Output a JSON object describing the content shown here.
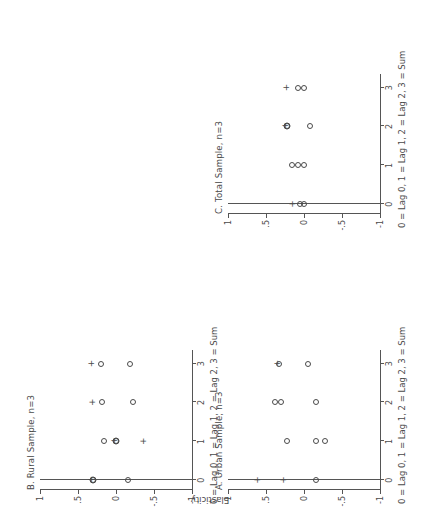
{
  "figure": {
    "y_axis_label": "Elasticity",
    "x_axis_caption": "0 = Lag 0, 1 = Lag 1, 2 = Lag 2, 3 = Sum",
    "y_ticklabels": [
      "1",
      ".5",
      "0",
      "-.5",
      "-1"
    ],
    "y_tickvalues": [
      1,
      0.5,
      0,
      -0.5,
      -1
    ],
    "x_ticklabels": [
      "0",
      "1",
      "2",
      "3"
    ],
    "x_tickvalues": [
      0,
      1,
      2,
      3
    ],
    "axis_color": "#555555",
    "marker_color": "#4a4a4a",
    "background": "#ffffff",
    "panels": [
      {
        "id": "A",
        "title": "A. Urban Sample, n=3"
      },
      {
        "id": "B",
        "title": "B. Rural Sample, n=3"
      },
      {
        "id": "C",
        "title": "C. Total Sample, n=3"
      }
    ]
  },
  "chart_data": [
    {
      "type": "scatter",
      "panel": "A",
      "title": "A. Urban Sample, n=3",
      "xlabel": "0 = Lag 0, 1 = Lag 1, 2 = Lag 2, 3 = Sum",
      "ylabel": "Elasticity",
      "xlim": [
        -0.25,
        3.35
      ],
      "ylim": [
        -1.0,
        1.0
      ],
      "xticks": [
        0,
        1,
        2,
        3
      ],
      "xticklabels": [
        "0",
        "1",
        "2",
        "3"
      ],
      "yticks": [
        1,
        0.5,
        0,
        -0.5,
        -1
      ],
      "yticklabels": [
        "1",
        ".5",
        "0",
        "-.5",
        "-1"
      ],
      "grid": false,
      "legend": false,
      "series": [
        {
          "name": "Estimate (circle)",
          "marker": "circle",
          "points": [
            {
              "x": 0.0,
              "y": -0.16
            },
            {
              "x": 1.0,
              "y": -0.16
            },
            {
              "x": 1.0,
              "y": -0.28
            },
            {
              "x": 1.0,
              "y": 0.22
            },
            {
              "x": 2.0,
              "y": -0.16
            },
            {
              "x": 2.0,
              "y": 0.3
            },
            {
              "x": 2.0,
              "y": 0.38
            },
            {
              "x": 3.0,
              "y": -0.05
            },
            {
              "x": 3.0,
              "y": 0.33
            }
          ]
        },
        {
          "name": "Significant (plus)",
          "marker": "plus",
          "points": [
            {
              "x": 0.0,
              "y": 0.28
            },
            {
              "x": 0.0,
              "y": 0.62
            },
            {
              "x": 3.0,
              "y": 0.36
            }
          ]
        }
      ]
    },
    {
      "type": "scatter",
      "panel": "B",
      "title": "B. Rural Sample, n=3",
      "xlabel": "0 = Lag 0, 1 = Lag 1, 2 = Lag 2, 3 = Sum",
      "ylabel": "Elasticity",
      "xlim": [
        -0.25,
        3.35
      ],
      "ylim": [
        -1.0,
        1.0
      ],
      "xticks": [
        0,
        1,
        2,
        3
      ],
      "xticklabels": [
        "0",
        "1",
        "2",
        "3"
      ],
      "yticks": [
        1,
        0.5,
        0,
        -0.5,
        -1
      ],
      "yticklabels": [
        "1",
        ".5",
        "0",
        "-.5",
        "-1"
      ],
      "grid": false,
      "legend": false,
      "series": [
        {
          "name": "Estimate (circle)",
          "marker": "circle",
          "points": [
            {
              "x": 0.0,
              "y": -0.16
            },
            {
              "x": 0.0,
              "y": 0.3
            },
            {
              "x": 1.0,
              "y": 0.0
            },
            {
              "x": 1.0,
              "y": 0.16
            },
            {
              "x": 2.0,
              "y": -0.22
            },
            {
              "x": 2.0,
              "y": 0.18
            },
            {
              "x": 3.0,
              "y": -0.18
            },
            {
              "x": 3.0,
              "y": 0.2
            }
          ]
        },
        {
          "name": "Significant (plus)",
          "marker": "plus",
          "points": [
            {
              "x": 1.0,
              "y": -0.36
            },
            {
              "x": 2.0,
              "y": 0.31
            },
            {
              "x": 3.0,
              "y": 0.33
            }
          ]
        },
        {
          "name": "Overlap (circle+plus)",
          "marker": "circleplus",
          "points": [
            {
              "x": 0.0,
              "y": 0.3
            },
            {
              "x": 1.0,
              "y": 0.0
            }
          ]
        }
      ]
    },
    {
      "type": "scatter",
      "panel": "C",
      "title": "C. Total Sample, n=3",
      "xlabel": "0 = Lag 0, 1 = Lag 1, 2 = Lag 2, 3 = Sum",
      "ylabel": "Elasticity",
      "xlim": [
        -0.25,
        3.35
      ],
      "ylim": [
        -1.0,
        1.0
      ],
      "xticks": [
        0,
        1,
        2,
        3
      ],
      "xticklabels": [
        "0",
        "1",
        "2",
        "3"
      ],
      "yticks": [
        1,
        0.5,
        0,
        -0.5,
        -1
      ],
      "yticklabels": [
        "1",
        ".5",
        "0",
        "-.5",
        "-1"
      ],
      "grid": false,
      "legend": false,
      "series": [
        {
          "name": "Estimate (circle)",
          "marker": "circle",
          "points": [
            {
              "x": 0.0,
              "y": 0.0
            },
            {
              "x": 0.0,
              "y": 0.05
            },
            {
              "x": 1.0,
              "y": 0.0
            },
            {
              "x": 1.0,
              "y": 0.08
            },
            {
              "x": 1.0,
              "y": 0.16
            },
            {
              "x": 2.0,
              "y": -0.08
            },
            {
              "x": 2.0,
              "y": 0.22
            },
            {
              "x": 3.0,
              "y": 0.0
            },
            {
              "x": 3.0,
              "y": 0.08
            }
          ]
        },
        {
          "name": "Significant (plus)",
          "marker": "plus",
          "points": [
            {
              "x": 0.0,
              "y": 0.16
            },
            {
              "x": 3.0,
              "y": 0.24
            }
          ]
        },
        {
          "name": "Overlap (circle+plus)",
          "marker": "circleplus",
          "points": [
            {
              "x": 2.0,
              "y": 0.22
            }
          ]
        }
      ]
    }
  ]
}
